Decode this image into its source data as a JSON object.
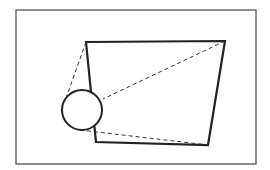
{
  "diagram": {
    "frame": {
      "x": 16,
      "y": 10,
      "width": 240,
      "height": 154,
      "color": "#444444"
    },
    "quadrilateral": {
      "points": [
        [
          86,
          42
        ],
        [
          225,
          41
        ],
        [
          208,
          145
        ],
        [
          96,
          142
        ]
      ],
      "color": "#222222"
    },
    "circle": {
      "cx": 82,
      "cy": 110,
      "r": 20,
      "color": "#222222"
    },
    "dashed_lines": [
      {
        "from": [
          86,
          42
        ],
        "to": [
          66,
          98
        ]
      },
      {
        "from": [
          225,
          41
        ],
        "to": [
          103,
          99
        ]
      },
      {
        "from": [
          80,
          130
        ],
        "to": [
          208,
          145
        ]
      }
    ],
    "dash_color": "#333333"
  }
}
